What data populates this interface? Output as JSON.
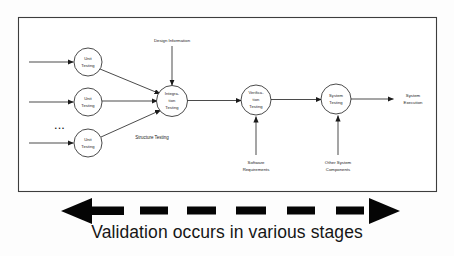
{
  "diagram": {
    "frame": {
      "border_color": "#3d3d3d",
      "background": "#ffffff"
    },
    "nodes": [
      {
        "id": "unit-testing-1",
        "line1": "Unit",
        "line2": "Testing",
        "line3": "",
        "cx": 88,
        "cy": 62
      },
      {
        "id": "unit-testing-2",
        "line1": "Unit",
        "line2": "Testing",
        "line3": "",
        "cx": 88,
        "cy": 102
      },
      {
        "id": "unit-testing-3",
        "line1": "Unit",
        "line2": "Testing",
        "line3": "",
        "cx": 88,
        "cy": 143
      },
      {
        "id": "integration-testing",
        "line1": "Integra-",
        "line2": "tion",
        "line3": "Testing",
        "cx": 172,
        "cy": 101
      },
      {
        "id": "verification-testing",
        "line1": "Verifica-",
        "line2": "tion",
        "line3": "Testing",
        "cx": 256,
        "cy": 100
      },
      {
        "id": "system-testing",
        "line1": "System",
        "line2": "Testing",
        "line3": "",
        "cx": 336,
        "cy": 99
      }
    ],
    "input_labels": [
      {
        "id": "design-information",
        "text": "Design Information",
        "x": 172,
        "y": 41
      },
      {
        "id": "software-requirements",
        "line1": "Software",
        "line2": "Requirements",
        "x": 256,
        "y": 163
      },
      {
        "id": "other-system-components",
        "line1": "Other System",
        "line2": "Components",
        "x": 338,
        "y": 163
      }
    ],
    "output_label": {
      "id": "system-execution",
      "line1": "System",
      "line2": "Execution",
      "x": 413,
      "y": 99
    },
    "edge_labels": [
      {
        "id": "structure-testing",
        "text": "Structure Testing",
        "x": 152,
        "y": 138
      }
    ],
    "ellipsis": {
      "text": "...",
      "x": 60,
      "y": 127
    }
  },
  "caption": {
    "text": "Validation occurs in various stages",
    "arrow": {
      "direction": "bidirectional",
      "style": "dashed",
      "color": "#050505"
    }
  },
  "colors": {
    "stroke": "#2b2b2b",
    "frame": "#3d3d3d",
    "arrow_fill": "#050505",
    "text": "#1a1a1a",
    "page_background": "#fdfdfd"
  }
}
